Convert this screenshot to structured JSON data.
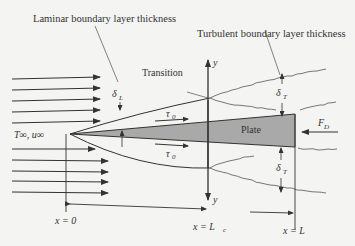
{
  "labels": {
    "laminar": "Laminar boundary layer thickness",
    "turbulent": "Turbulent boundary layer thickness",
    "transition": "Transition",
    "plate": "Plate",
    "free_stream": "T∞, u∞",
    "delta_L": "δ",
    "delta_L_sub": "L",
    "delta_T": "δ",
    "delta_T_sub": "T",
    "tau0": "τ",
    "tau0_sub": "0",
    "F_D": "F",
    "F_D_sub": "D",
    "y_top": "y",
    "y_bottom": "y",
    "x0": "x = 0",
    "xLc": "x = L",
    "xLc_sub": "c",
    "xL": "x = L"
  },
  "colors": {
    "background": "#f4f4f2",
    "plate_fill": "#a9a9a9",
    "line": "#333333"
  }
}
